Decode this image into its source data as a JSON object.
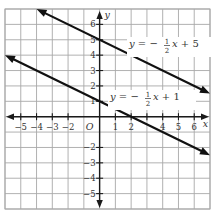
{
  "chart_data": {
    "type": "line",
    "title": "",
    "xlabel": "x",
    "ylabel": "y",
    "origin_label": "O",
    "xlim": [
      -6,
      7
    ],
    "ylim": [
      -6,
      7
    ],
    "grid": true,
    "x_ticks": [
      -5,
      -4,
      -3,
      -2,
      1,
      2,
      3,
      4,
      5,
      6
    ],
    "x_tick_labels": [
      "−5",
      "−4",
      "−3",
      "−2",
      "1",
      "2",
      "",
      "4",
      "5",
      "6"
    ],
    "y_ticks": [
      -5,
      -4,
      -3,
      -2,
      1,
      2,
      3,
      4,
      5,
      6
    ],
    "y_tick_labels": [
      "−5",
      "−4",
      "−3",
      "−2",
      "1",
      "2",
      "3",
      "4",
      "5",
      "6"
    ],
    "series": [
      {
        "name": "y = -1/2 x + 5",
        "slope": -0.5,
        "intercept": 5,
        "x_range": [
          -4,
          7
        ],
        "arrows": "both",
        "label": {
          "prefix": "y = −",
          "num": "1",
          "den": "2",
          "suffix": "x + 5"
        }
      },
      {
        "name": "y = -1/2 x + 1",
        "slope": -0.5,
        "intercept": 1,
        "x_range": [
          -6,
          7
        ],
        "arrows": "both",
        "label": {
          "prefix": "y = −",
          "num": "1",
          "den": "2",
          "suffix": "x + 1"
        }
      }
    ],
    "color": "#111111",
    "grid_color": "#a8a8a8"
  }
}
